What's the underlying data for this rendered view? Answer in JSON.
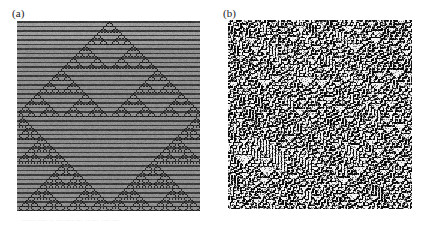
{
  "figure": {
    "background_color": "#ffffff",
    "width": 426,
    "height": 226,
    "caption_fragment": "......   ....  ..   ...  ....    ...   ..   ...   ....  ..."
  },
  "panels": [
    {
      "id": "panel-a",
      "label": "(a)",
      "kind": "cellular-automaton-ordered",
      "x": 17,
      "y": 21,
      "width": 183,
      "height": 190,
      "colors": {
        "band_dark": "#3a3a3a",
        "band_light": "#8f8f8f",
        "cell_on": "#141414",
        "cell_off": "#b9b9b9"
      }
    },
    {
      "id": "panel-b",
      "label": "(b)",
      "kind": "cellular-automaton-chaotic",
      "x": 228,
      "y": 20,
      "width": 184,
      "height": 189,
      "colors": {
        "cell_on": "#0d0d0d",
        "cell_off": "#f2f2f2",
        "cell_mid": "#7d7d7d"
      }
    }
  ],
  "chart_data": {
    "type": "heatmap",
    "title": "",
    "xlabel": "",
    "ylabel": "",
    "grid": false,
    "legend_position": "none",
    "panels": [
      {
        "label": "(a)",
        "description": "Space-time diagram of a one-dimensional cellular automaton started from a single seed, producing a nested Sierpinski-triangle fractal superimposed on horizontal banding.",
        "cols": 122,
        "rows": 127,
        "rule": 90,
        "initial_condition": "single-seed",
        "band_period": 3,
        "value_range": [
          0,
          1
        ]
      },
      {
        "label": "(b)",
        "description": "Space-time diagram of a one-dimensional cellular automaton started from a random initial condition, producing spatiotemporal chaos with no large-scale order.",
        "cols": 123,
        "rows": 126,
        "rule": 30,
        "initial_condition": "random",
        "density": 0.5,
        "value_range": [
          0,
          1
        ]
      }
    ]
  }
}
